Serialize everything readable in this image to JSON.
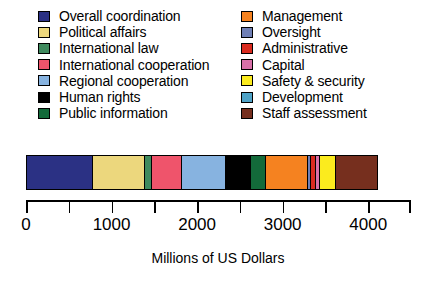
{
  "chart_data": {
    "type": "bar",
    "orientation": "horizontal-stacked",
    "title": "",
    "xlabel": "Millions of US Dollars",
    "ylabel": "",
    "xlim": [
      0,
      4500
    ],
    "grid": false,
    "legend_position": "top",
    "tick_labels": [
      "0",
      "1000",
      "2000",
      "3000",
      "4000"
    ],
    "tick_values": [
      0,
      1000,
      2000,
      3000,
      4000
    ],
    "minor_tick_values": [
      500,
      1500,
      2500,
      3500,
      4500
    ],
    "categories": [
      "Overall coordination",
      "Political affairs",
      "International law",
      "International cooperation",
      "Regional cooperation",
      "Human rights",
      "Public information",
      "Management",
      "Oversight",
      "Administrative",
      "Capital",
      "Safety & security",
      "Development",
      "Staff assessment"
    ],
    "values": [
      772,
      608,
      82,
      351,
      515,
      292,
      175,
      491,
      35,
      58,
      47,
      187,
      0,
      480
    ],
    "colors": [
      "#2b3184",
      "#ecd77d",
      "#3f8a5e",
      "#ef546b",
      "#87b3e0",
      "#000000",
      "#136a3a",
      "#f58220",
      "#6f7fb5",
      "#d92b1f",
      "#d870a8",
      "#fbeb1e",
      "#4fa3c7",
      "#762f1e"
    ],
    "total": 4093
  },
  "legend": {
    "left_column": [
      {
        "label": "Overall coordination",
        "swatch": "legend-swatch-overall-coordination"
      },
      {
        "label": "Political affairs",
        "swatch": "legend-swatch-political-affairs"
      },
      {
        "label": "International law",
        "swatch": "legend-swatch-international-law"
      },
      {
        "label": "International cooperation",
        "swatch": "legend-swatch-international-cooperation"
      },
      {
        "label": "Regional cooperation",
        "swatch": "legend-swatch-regional-cooperation"
      },
      {
        "label": "Human rights",
        "swatch": "legend-swatch-human-rights"
      },
      {
        "label": "Public information",
        "swatch": "legend-swatch-public-information"
      }
    ],
    "right_column": [
      {
        "label": "Management",
        "swatch": "legend-swatch-management"
      },
      {
        "label": "Oversight",
        "swatch": "legend-swatch-oversight"
      },
      {
        "label": "Administrative",
        "swatch": "legend-swatch-administrative"
      },
      {
        "label": "Capital",
        "swatch": "legend-swatch-capital"
      },
      {
        "label": "Safety & security",
        "swatch": "legend-swatch-safety-security"
      },
      {
        "label": "Development",
        "swatch": "legend-swatch-development"
      },
      {
        "label": "Staff assessment",
        "swatch": "legend-swatch-staff-assessment"
      }
    ]
  }
}
